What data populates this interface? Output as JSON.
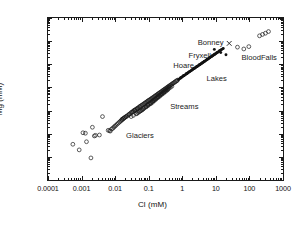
{
  "chart_data": {
    "type": "scatter",
    "title": "",
    "xlabel": "Cl (mM)",
    "ylabel": "Mg (mM)",
    "xscale": "log",
    "yscale": "log",
    "xlim": [
      0.0001,
      1000
    ],
    "ylim": [
      1e-05,
      100
    ],
    "grid": false,
    "legend_position": "none",
    "xticks": [
      "0.0001",
      "0.001",
      "0.01",
      "0.1",
      "1",
      "10",
      "100",
      "1000"
    ],
    "xtick_values": [
      0.0001,
      0.001,
      0.01,
      0.1,
      1,
      10,
      100,
      1000
    ],
    "yticks": [
      "100",
      "10",
      "1",
      "0.1",
      "0.01",
      "0.001",
      "0.0001",
      "10-5"
    ],
    "ytick_values": [
      100,
      10,
      1,
      0.1,
      0.01,
      0.001,
      0.0001,
      1e-05
    ],
    "ytick_last_base": "10",
    "ytick_last_exp": "-5",
    "annotations": [
      {
        "text": "Glaciers",
        "x": 0.055,
        "y": 0.0009
      },
      {
        "text": "Streams",
        "x": 1.15,
        "y": 0.016
      },
      {
        "text": "Hoare",
        "x": 1.1,
        "y": 0.95
      },
      {
        "text": "Fryxell",
        "x": 3.3,
        "y": 2.6
      },
      {
        "text": "Bonney",
        "x": 7.0,
        "y": 9.5
      },
      {
        "text": "Lakes",
        "x": 10.5,
        "y": 0.26
      },
      {
        "text": "BloodFalls",
        "x": 195,
        "y": 2.1
      }
    ],
    "series": [
      {
        "name": "Glaciers",
        "marker": "open-circle",
        "color": "#1a1a1a",
        "points": [
          [
            0.00055,
            0.00035
          ],
          [
            0.00085,
            0.0002
          ],
          [
            0.0011,
            0.0011
          ],
          [
            0.0013,
            0.00105
          ],
          [
            0.0014,
            0.00045
          ],
          [
            0.0019,
            9e-05
          ],
          [
            0.0021,
            0.0019
          ],
          [
            0.0024,
            0.0008
          ],
          [
            0.0026,
            0.00085
          ],
          [
            0.0034,
            0.00088
          ],
          [
            0.0042,
            0.0055
          ],
          [
            0.0062,
            0.0014
          ],
          [
            0.0068,
            0.00135
          ],
          [
            0.0072,
            0.0013
          ],
          [
            0.0078,
            0.0016
          ],
          [
            0.0085,
            0.0017
          ],
          [
            0.0091,
            0.0019
          ],
          [
            0.0098,
            0.0021
          ],
          [
            0.0105,
            0.0023
          ],
          [
            0.0115,
            0.0026
          ],
          [
            0.0125,
            0.0029
          ],
          [
            0.0135,
            0.0032
          ],
          [
            0.0145,
            0.0035
          ],
          [
            0.0155,
            0.0038
          ],
          [
            0.0165,
            0.0041
          ],
          [
            0.0178,
            0.0045
          ]
        ]
      },
      {
        "name": "Streams",
        "marker": "open-circle",
        "color": "#1a1a1a",
        "points": [
          [
            0.019,
            0.0049
          ],
          [
            0.021,
            0.0054
          ],
          [
            0.023,
            0.006
          ],
          [
            0.025,
            0.0065
          ],
          [
            0.027,
            0.0071
          ],
          [
            0.029,
            0.0078
          ],
          [
            0.031,
            0.0085
          ],
          [
            0.034,
            0.0092
          ],
          [
            0.036,
            0.0099
          ],
          [
            0.038,
            0.0105
          ],
          [
            0.041,
            0.0112
          ],
          [
            0.044,
            0.012
          ],
          [
            0.047,
            0.0128
          ],
          [
            0.05,
            0.0135
          ],
          [
            0.053,
            0.0145
          ],
          [
            0.056,
            0.0155
          ],
          [
            0.06,
            0.0165
          ],
          [
            0.064,
            0.0175
          ],
          [
            0.068,
            0.0185
          ],
          [
            0.072,
            0.0195
          ],
          [
            0.076,
            0.021
          ],
          [
            0.081,
            0.022
          ],
          [
            0.086,
            0.0235
          ],
          [
            0.091,
            0.025
          ],
          [
            0.096,
            0.0265
          ],
          [
            0.102,
            0.028
          ],
          [
            0.108,
            0.0295
          ],
          [
            0.114,
            0.031
          ],
          [
            0.121,
            0.033
          ],
          [
            0.128,
            0.035
          ],
          [
            0.136,
            0.037
          ],
          [
            0.144,
            0.039
          ],
          [
            0.152,
            0.042
          ],
          [
            0.161,
            0.044
          ],
          [
            0.171,
            0.047
          ],
          [
            0.181,
            0.05
          ],
          [
            0.192,
            0.053
          ],
          [
            0.203,
            0.056
          ],
          [
            0.215,
            0.06
          ],
          [
            0.228,
            0.063
          ],
          [
            0.242,
            0.067
          ],
          [
            0.256,
            0.071
          ],
          [
            0.271,
            0.076
          ],
          [
            0.287,
            0.08
          ],
          [
            0.304,
            0.085
          ],
          [
            0.322,
            0.09
          ],
          [
            0.341,
            0.096
          ],
          [
            0.362,
            0.102
          ],
          [
            0.383,
            0.108
          ],
          [
            0.406,
            0.115
          ],
          [
            0.43,
            0.122
          ],
          [
            0.456,
            0.129
          ],
          [
            0.483,
            0.137
          ],
          [
            0.512,
            0.145
          ],
          [
            0.542,
            0.154
          ],
          [
            0.575,
            0.163
          ],
          [
            0.609,
            0.173
          ],
          [
            0.645,
            0.184
          ],
          [
            0.684,
            0.195
          ],
          [
            0.724,
            0.207
          ],
          [
            0.045,
            0.0075
          ],
          [
            0.055,
            0.0095
          ],
          [
            0.065,
            0.011
          ],
          [
            0.075,
            0.0135
          ],
          [
            0.088,
            0.016
          ],
          [
            0.098,
            0.019
          ],
          [
            0.112,
            0.0215
          ],
          [
            0.125,
            0.0245
          ],
          [
            0.14,
            0.028
          ],
          [
            0.158,
            0.0315
          ],
          [
            0.175,
            0.036
          ],
          [
            0.195,
            0.041
          ],
          [
            0.22,
            0.047
          ],
          [
            0.245,
            0.053
          ],
          [
            0.275,
            0.06
          ],
          [
            0.31,
            0.069
          ],
          [
            0.35,
            0.078
          ],
          [
            0.39,
            0.088
          ],
          [
            0.44,
            0.1
          ],
          [
            0.49,
            0.113
          ],
          [
            0.035,
            0.0062
          ],
          [
            0.042,
            0.0072
          ],
          [
            0.052,
            0.0088
          ],
          [
            0.062,
            0.0105
          ],
          [
            0.071,
            0.0125
          ],
          [
            0.082,
            0.0145
          ],
          [
            0.094,
            0.017
          ],
          [
            0.106,
            0.0195
          ],
          [
            0.119,
            0.0225
          ],
          [
            0.133,
            0.026
          ],
          [
            0.149,
            0.03
          ],
          [
            0.167,
            0.0345
          ],
          [
            0.186,
            0.0395
          ],
          [
            0.208,
            0.0455
          ],
          [
            0.232,
            0.052
          ],
          [
            0.26,
            0.06
          ],
          [
            0.29,
            0.068
          ],
          [
            0.325,
            0.078
          ],
          [
            0.365,
            0.09
          ],
          [
            0.41,
            0.103
          ],
          [
            0.03,
            0.0055
          ],
          [
            0.048,
            0.0082
          ],
          [
            0.058,
            0.0098
          ],
          [
            0.069,
            0.0118
          ],
          [
            0.083,
            0.0142
          ],
          [
            0.097,
            0.0168
          ],
          [
            0.115,
            0.0198
          ],
          [
            0.131,
            0.023
          ],
          [
            0.147,
            0.0268
          ],
          [
            0.165,
            0.031
          ],
          [
            0.19,
            0.0365
          ],
          [
            0.215,
            0.042
          ],
          [
            0.245,
            0.0495
          ],
          [
            0.28,
            0.057
          ],
          [
            0.315,
            0.066
          ],
          [
            0.36,
            0.077
          ],
          [
            0.016,
            0.0042
          ],
          [
            0.0175,
            0.0046
          ],
          [
            0.0195,
            0.0051
          ],
          [
            0.0215,
            0.0056
          ],
          [
            0.026,
            0.0068
          ],
          [
            0.033,
            0.0086
          ],
          [
            0.039,
            0.0102
          ],
          [
            0.046,
            0.0118
          ]
        ]
      },
      {
        "name": "Lakes",
        "marker": "filled",
        "color": "#111111",
        "points": [
          [
            0.77,
            0.22
          ],
          [
            0.82,
            0.235
          ],
          [
            0.88,
            0.25
          ],
          [
            0.94,
            0.27
          ],
          [
            1.0,
            0.29
          ],
          [
            1.07,
            0.31
          ],
          [
            1.14,
            0.33
          ],
          [
            1.22,
            0.35
          ],
          [
            1.3,
            0.38
          ],
          [
            1.39,
            0.4
          ],
          [
            1.48,
            0.43
          ],
          [
            1.58,
            0.46
          ],
          [
            1.69,
            0.49
          ],
          [
            1.8,
            0.52
          ],
          [
            1.92,
            0.56
          ],
          [
            2.05,
            0.6
          ],
          [
            2.19,
            0.64
          ],
          [
            2.34,
            0.68
          ],
          [
            2.5,
            0.73
          ],
          [
            2.67,
            0.78
          ],
          [
            2.85,
            0.83
          ],
          [
            3.04,
            0.89
          ],
          [
            3.25,
            0.95
          ],
          [
            3.47,
            1.01
          ],
          [
            3.7,
            1.08
          ],
          [
            3.95,
            1.15
          ],
          [
            4.22,
            1.23
          ],
          [
            4.5,
            1.31
          ],
          [
            4.8,
            1.4
          ],
          [
            5.13,
            1.5
          ],
          [
            5.47,
            1.6
          ],
          [
            5.84,
            1.71
          ],
          [
            6.24,
            1.82
          ],
          [
            6.66,
            1.95
          ],
          [
            7.1,
            2.08
          ],
          [
            7.58,
            2.22
          ],
          [
            8.1,
            2.37
          ],
          [
            8.64,
            2.53
          ],
          [
            9.22,
            2.7
          ],
          [
            9.85,
            2.88
          ],
          [
            10.5,
            3.08
          ],
          [
            11.2,
            3.28
          ],
          [
            12.0,
            3.5
          ],
          [
            12.8,
            3.74
          ],
          [
            13.6,
            3.99
          ],
          [
            14.5,
            4.25
          ],
          [
            15.5,
            4.54
          ],
          [
            16.6,
            4.84
          ],
          [
            0.9,
            0.26
          ],
          [
            1.1,
            0.32
          ],
          [
            1.35,
            0.39
          ],
          [
            1.6,
            0.47
          ],
          [
            1.95,
            0.57
          ],
          [
            2.3,
            0.67
          ],
          [
            2.75,
            0.8
          ],
          [
            3.3,
            0.96
          ],
          [
            3.9,
            1.13
          ],
          [
            4.6,
            1.34
          ],
          [
            5.5,
            1.6
          ],
          [
            6.5,
            1.9
          ],
          [
            7.8,
            2.27
          ],
          [
            9.2,
            2.68
          ],
          [
            11.0,
            3.2
          ],
          [
            13.0,
            3.8
          ]
        ]
      },
      {
        "name": "Bonney",
        "marker": "filled",
        "color": "#111111",
        "points": [
          [
            9.0,
            4.4
          ],
          [
            14.0,
            3.2
          ],
          [
            20.0,
            2.6
          ]
        ]
      },
      {
        "name": "BloodFalls",
        "marker": "open-circle",
        "color": "#1a1a1a",
        "points": [
          [
            44.0,
            5.5
          ],
          [
            68.0,
            4.6
          ],
          [
            96.0,
            5.8
          ],
          [
            200.0,
            17.0
          ],
          [
            245.0,
            19.5
          ],
          [
            300.0,
            22.0
          ],
          [
            370.0,
            26.0
          ]
        ]
      },
      {
        "name": "Outlier",
        "marker": "cross",
        "color": "#1a1a1a",
        "points": [
          [
            25.0,
            8.0
          ]
        ]
      }
    ]
  }
}
